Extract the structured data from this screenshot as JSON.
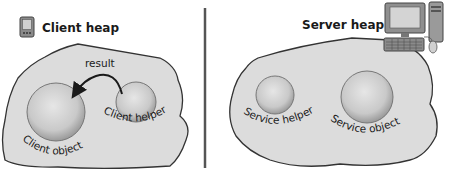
{
  "client": {
    "title": "Client heap",
    "icon": "pda-icon",
    "objects": [
      {
        "label": "Client object",
        "role": "large-sphere"
      },
      {
        "label": "Client helper",
        "role": "small-sphere"
      }
    ],
    "arrow_label": "result"
  },
  "server": {
    "title": "Server heap",
    "icon": "desktop-computer-icon",
    "objects": [
      {
        "label": "Service helper",
        "role": "small-sphere"
      },
      {
        "label": "Service object",
        "role": "large-sphere"
      }
    ]
  },
  "colors": {
    "heap_fill": "#dcdcdc",
    "heap_stroke": "#333333",
    "sphere_fill": "#c8c8c8",
    "divider": "#555555",
    "text": "#1a1a1a"
  }
}
